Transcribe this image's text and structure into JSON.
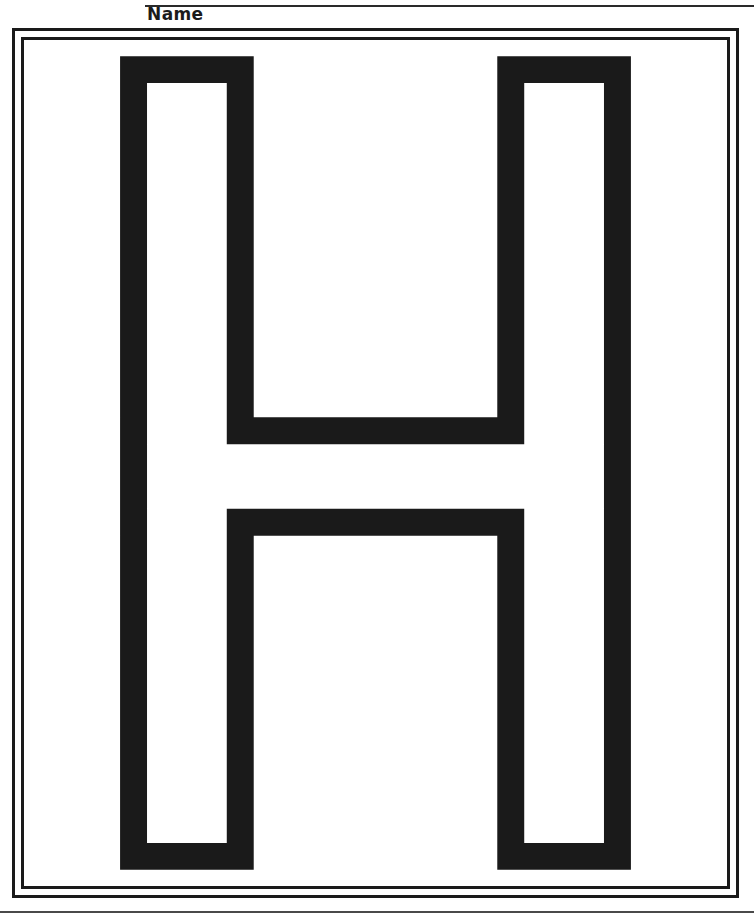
{
  "worksheet": {
    "type": "alphabet-letter-tracing-coloring-page",
    "name_label": "Name",
    "letter": "H",
    "letter_case": "uppercase",
    "background_color": "#ffffff",
    "ink_color": "#1a1a1a"
  },
  "header": {
    "name_label": "Name",
    "rule_color": "#2a2a2a"
  },
  "frame": {
    "style": "double-line-rectangle",
    "outer_border_color": "#1a1a1a",
    "inner_border_color": "#1a1a1a",
    "outer_border_width_px": 3,
    "inner_border_width_px": 3
  },
  "footer": {
    "rule_color": "#4a4a4a"
  },
  "letter_graphic": {
    "glyph": "H",
    "render_style": "hollow-outline",
    "fill_color": "#ffffff",
    "stroke_color": "#1a1a1a",
    "stroke_width_px": 25,
    "outer_path": "M 70 15 L 194 15 L 194 350 L 420 350 L 420 15 L 544 15 L 544 770 L 420 770 L 420 460 L 194 460 L 194 770 L 70 770 Z",
    "inner_path": "M 95 40 L 169 40 L 169 375 L 445 375 L 445 40 L 519 40 L 519 745 L 445 745 L 445 435 L 169 435 L 169 745 L 95 745 Z",
    "viewbox": "0 0 614 785"
  }
}
